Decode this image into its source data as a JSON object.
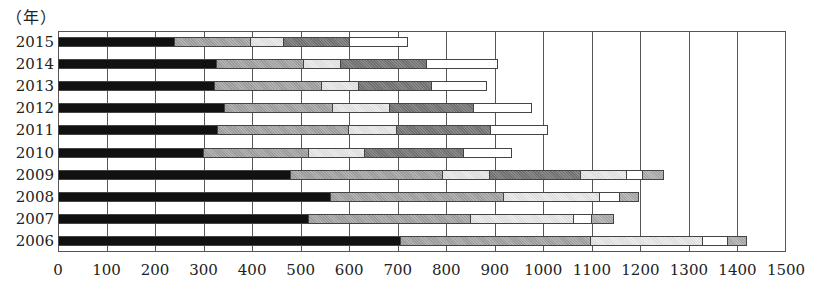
{
  "chart_data": {
    "type": "bar",
    "orientation": "horizontal",
    "stacked": true,
    "title": "",
    "unit_label": "（年）",
    "xlabel": "",
    "ylabel": "（年）",
    "xlim": [
      0,
      1500
    ],
    "x_ticks": [
      0,
      100,
      200,
      300,
      400,
      500,
      600,
      700,
      800,
      900,
      1000,
      1100,
      1200,
      1300,
      1400,
      1500
    ],
    "grid": "vertical",
    "legend": "cropped at bottom (illegible)",
    "categories": [
      "2015",
      "2014",
      "2013",
      "2012",
      "2011",
      "2010",
      "2009",
      "2008",
      "2007",
      "2006"
    ],
    "rows": [
      {
        "year": "2015",
        "segments": [
          {
            "style": "black",
            "value": 241
          },
          {
            "style": "medgray",
            "value": 157
          },
          {
            "style": "light",
            "value": 68
          },
          {
            "style": "dark",
            "value": 136
          },
          {
            "style": "white",
            "value": 119
          }
        ],
        "total": 721
      },
      {
        "year": "2014",
        "segments": [
          {
            "style": "black",
            "value": 328
          },
          {
            "style": "medgray",
            "value": 179
          },
          {
            "style": "light",
            "value": 76
          },
          {
            "style": "dark",
            "value": 177
          },
          {
            "style": "white",
            "value": 146
          }
        ],
        "total": 906
      },
      {
        "year": "2013",
        "segments": [
          {
            "style": "black",
            "value": 323
          },
          {
            "style": "medgray",
            "value": 221
          },
          {
            "style": "light",
            "value": 76
          },
          {
            "style": "dark",
            "value": 151
          },
          {
            "style": "white",
            "value": 113
          }
        ],
        "total": 884
      },
      {
        "year": "2012",
        "segments": [
          {
            "style": "black",
            "value": 344
          },
          {
            "style": "medgray",
            "value": 223
          },
          {
            "style": "light",
            "value": 117
          },
          {
            "style": "dark",
            "value": 173
          },
          {
            "style": "white",
            "value": 120
          }
        ],
        "total": 977
      },
      {
        "year": "2011",
        "segments": [
          {
            "style": "black",
            "value": 330
          },
          {
            "style": "medgray",
            "value": 270
          },
          {
            "style": "light",
            "value": 98
          },
          {
            "style": "dark",
            "value": 194
          },
          {
            "style": "white",
            "value": 118
          }
        ],
        "total": 1010
      },
      {
        "year": "2010",
        "segments": [
          {
            "style": "black",
            "value": 301
          },
          {
            "style": "medgray",
            "value": 216
          },
          {
            "style": "light",
            "value": 116
          },
          {
            "style": "dark",
            "value": 204
          },
          {
            "style": "white",
            "value": 99
          }
        ],
        "total": 936
      },
      {
        "year": "2009",
        "segments": [
          {
            "style": "black",
            "value": 480
          },
          {
            "style": "medgray",
            "value": 313
          },
          {
            "style": "light",
            "value": 97
          },
          {
            "style": "dark",
            "value": 188
          },
          {
            "style": "light",
            "value": 94
          },
          {
            "style": "white",
            "value": 34
          },
          {
            "style": "gray",
            "value": 43
          }
        ],
        "total": 1249
      },
      {
        "year": "2008",
        "segments": [
          {
            "style": "black",
            "value": 562
          },
          {
            "style": "medgray",
            "value": 357
          },
          {
            "style": "light",
            "value": 198
          },
          {
            "style": "white",
            "value": 41
          },
          {
            "style": "gray",
            "value": 39
          }
        ],
        "total": 1197
      },
      {
        "year": "2007",
        "segments": [
          {
            "style": "black",
            "value": 517
          },
          {
            "style": "medgray",
            "value": 334
          },
          {
            "style": "light",
            "value": 212
          },
          {
            "style": "white",
            "value": 37
          },
          {
            "style": "gray",
            "value": 45
          }
        ],
        "total": 1145
      },
      {
        "year": "2006",
        "segments": [
          {
            "style": "black",
            "value": 707
          },
          {
            "style": "medgray",
            "value": 391
          },
          {
            "style": "light",
            "value": 231
          },
          {
            "style": "white",
            "value": 52
          },
          {
            "style": "gray",
            "value": 39
          }
        ],
        "total": 1420
      }
    ]
  },
  "layout": {
    "plot_left": 58,
    "plot_top": 31,
    "plot_width": 728,
    "plot_height": 221,
    "first_bar_center": 42,
    "row_step": 22.1,
    "bar_height": 10
  }
}
